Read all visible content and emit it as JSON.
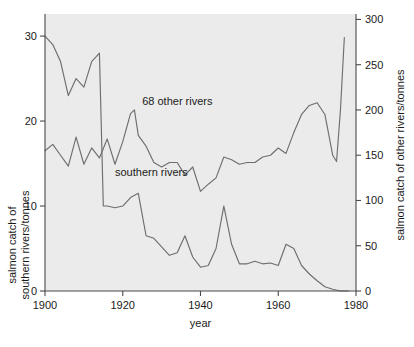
{
  "chart_data": {
    "type": "line",
    "title": "",
    "xlabel": "year",
    "ylabel": "salmon catch of southern rivers/tonnes",
    "ylabel_right": "salmon catch of other rivers/tonnes",
    "xlim": [
      1900,
      1980
    ],
    "ylim": [
      0,
      32.6
    ],
    "ylim_right": [
      0,
      306
    ],
    "grid": false,
    "legend_position": "inline-annotation",
    "xticks": [
      1900,
      1920,
      1940,
      1960,
      1980
    ],
    "xtick_labels": [
      "1900",
      "1920",
      "1940",
      "1960",
      "1980"
    ],
    "yticks": [
      0,
      10,
      20,
      30
    ],
    "ytick_labels": [
      "0",
      "10",
      "20",
      "30"
    ],
    "yticks_right": [
      0,
      50,
      100,
      150,
      200,
      250,
      300
    ],
    "ytick_labels_right": [
      "0",
      "50",
      "100",
      "150",
      "200",
      "250",
      "300"
    ],
    "annotations": [
      {
        "text": "68 other rivers",
        "x": 1925,
        "y": 205,
        "axis": "right"
      },
      {
        "text": "southern rivers",
        "x": 1918,
        "y": 13.5,
        "axis": "left"
      }
    ],
    "series": [
      {
        "name": "68 other rivers",
        "axis": "right",
        "x": [
          1900,
          1902,
          1904,
          1906,
          1908,
          1910,
          1912,
          1914,
          1916,
          1918,
          1920,
          1922,
          1923,
          1924,
          1926,
          1928,
          1930,
          1932,
          1934,
          1936,
          1938,
          1940,
          1942,
          1944,
          1946,
          1948,
          1950,
          1952,
          1954,
          1956,
          1958,
          1960,
          1962,
          1964,
          1966,
          1968,
          1970,
          1972,
          1974,
          1975,
          1976,
          1977
        ],
        "values": [
          155,
          162,
          150,
          138,
          170,
          140,
          158,
          147,
          168,
          140,
          165,
          196,
          200,
          172,
          160,
          142,
          137,
          142,
          142,
          128,
          137,
          110,
          118,
          125,
          148,
          145,
          140,
          142,
          142,
          148,
          150,
          158,
          152,
          175,
          195,
          205,
          208,
          195,
          150,
          143,
          200,
          280
        ]
      },
      {
        "name": "southern rivers",
        "axis": "left",
        "x": [
          1900,
          1902,
          1904,
          1906,
          1908,
          1910,
          1912,
          1914,
          1915,
          1916,
          1918,
          1920,
          1922,
          1924,
          1926,
          1928,
          1930,
          1932,
          1934,
          1936,
          1938,
          1940,
          1942,
          1944,
          1946,
          1948,
          1950,
          1952,
          1954,
          1956,
          1958,
          1960,
          1962,
          1964,
          1966,
          1968,
          1970,
          1972,
          1974,
          1976,
          1978
        ],
        "values": [
          30,
          29,
          27,
          23,
          25,
          24,
          27,
          28,
          10,
          10,
          9.8,
          10,
          11,
          11.5,
          6.5,
          6.2,
          5.2,
          4.2,
          4.5,
          6.5,
          4.0,
          2.8,
          3.0,
          5.0,
          10,
          5.5,
          3.2,
          3.2,
          3.5,
          3.2,
          3.3,
          3.0,
          5.5,
          5.0,
          3.0,
          2.0,
          1.2,
          0.5,
          0.2,
          0.0,
          0.0
        ]
      }
    ]
  },
  "axes": {
    "x_title": "year",
    "y_left_title_line1": "salmon catch of",
    "y_left_title_line2": "southern rivers/tonnes",
    "y_right_title": "salmon catch of other rivers/tonnes"
  },
  "labels": {
    "other_rivers": "68 other rivers",
    "southern_rivers": "southern rivers"
  },
  "colors": {
    "plot_background": "#ebebeb",
    "page_background": "#ffffff",
    "line": "#6e6e6e",
    "axis": "#4a4a4a",
    "text": "#1a1a1a"
  }
}
